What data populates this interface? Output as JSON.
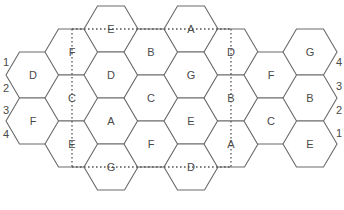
{
  "diagram": {
    "hex": {
      "side": 27,
      "half_height": 23
    },
    "cells": [
      {
        "label": "D",
        "x": 33,
        "y": 75
      },
      {
        "label": "F",
        "x": 33,
        "y": 121
      },
      {
        "label": "F",
        "x": 72,
        "y": 52
      },
      {
        "label": "C",
        "x": 72,
        "y": 98
      },
      {
        "label": "E",
        "x": 72,
        "y": 144
      },
      {
        "label": "E",
        "x": 111,
        "y": 29
      },
      {
        "label": "D",
        "x": 111,
        "y": 75
      },
      {
        "label": "A",
        "x": 111,
        "y": 121
      },
      {
        "label": "G",
        "x": 111,
        "y": 167
      },
      {
        "label": "B",
        "x": 151,
        "y": 52
      },
      {
        "label": "C",
        "x": 151,
        "y": 98
      },
      {
        "label": "F",
        "x": 151,
        "y": 144
      },
      {
        "label": "A",
        "x": 191,
        "y": 29
      },
      {
        "label": "G",
        "x": 191,
        "y": 75
      },
      {
        "label": "E",
        "x": 191,
        "y": 121
      },
      {
        "label": "D",
        "x": 191,
        "y": 167
      },
      {
        "label": "D",
        "x": 231,
        "y": 52
      },
      {
        "label": "B",
        "x": 231,
        "y": 98
      },
      {
        "label": "A",
        "x": 231,
        "y": 144
      },
      {
        "label": "F",
        "x": 271,
        "y": 75
      },
      {
        "label": "C",
        "x": 271,
        "y": 121
      },
      {
        "label": "G",
        "x": 310,
        "y": 52
      },
      {
        "label": "B",
        "x": 310,
        "y": 98
      },
      {
        "label": "E",
        "x": 310,
        "y": 144
      }
    ],
    "dotted_rect": {
      "x1": 72,
      "y1": 29,
      "x2": 231,
      "y2": 167
    },
    "left_numbers": [
      {
        "label": "1",
        "x": 6,
        "y": 62
      },
      {
        "label": "2",
        "x": 6,
        "y": 88
      },
      {
        "label": "3",
        "x": 6,
        "y": 110
      },
      {
        "label": "4",
        "x": 6,
        "y": 134
      }
    ],
    "right_numbers": [
      {
        "label": "4",
        "x": 339,
        "y": 62
      },
      {
        "label": "3",
        "x": 339,
        "y": 86
      },
      {
        "label": "2",
        "x": 339,
        "y": 110
      },
      {
        "label": "1",
        "x": 339,
        "y": 133
      }
    ]
  }
}
